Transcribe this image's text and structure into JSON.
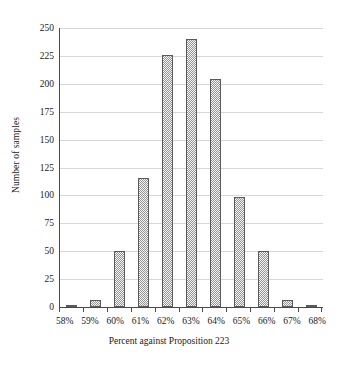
{
  "chart_data": {
    "type": "bar",
    "title": "",
    "subtitle": "",
    "xlabel": "Percent against Proposition 223",
    "ylabel": "Number of samples",
    "categories": [
      "58%",
      "59%",
      "60%",
      "61%",
      "62%",
      "63%",
      "64%",
      "65%",
      "66%",
      "67%",
      "68%"
    ],
    "values": [
      2,
      6,
      50,
      116,
      226,
      240,
      204,
      99,
      50,
      6,
      1
    ],
    "ylim": [
      0,
      250
    ],
    "yticks": [
      0,
      25,
      50,
      75,
      100,
      125,
      150,
      175,
      200,
      225,
      250
    ],
    "ytick_labels": [
      "0",
      "25",
      "50",
      "75",
      "100",
      "125",
      "150",
      "175",
      "200",
      "225",
      "250"
    ],
    "grid": "horizontal",
    "legend": "none",
    "bar_fill_color": "#b9b9b9",
    "bar_border_color": "#5a5a5a",
    "gridline_color": "#d8d8d8",
    "axis_color": "#4a4a4a",
    "background_color": "#ffffff"
  }
}
